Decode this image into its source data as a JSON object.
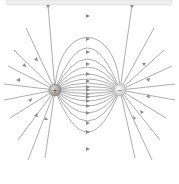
{
  "diagram": {
    "title": "Electric field lines of an electric dipole",
    "charges": [
      {
        "name": "positive-charge",
        "sign": "+",
        "x": 55,
        "y": 90,
        "color": "#9a9a9a"
      },
      {
        "name": "negative-charge",
        "sign": "−",
        "x": 120,
        "y": 90,
        "color": "#d6d6d6"
      }
    ],
    "line_color": "#7a7a7a",
    "top_bar_color": "#eeeeee",
    "arrow_direction": "from positive to negative"
  }
}
